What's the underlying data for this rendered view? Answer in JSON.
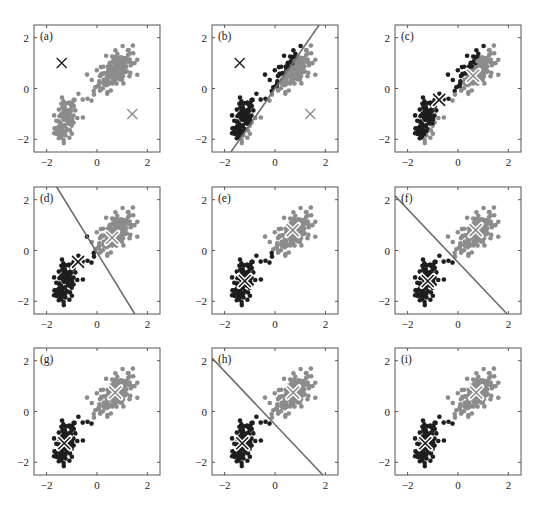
{
  "colors": {
    "dark": "#1e1e1e",
    "gray": "#8c8c8c",
    "axis": "#555555",
    "boundary": "#6e6e6e",
    "centroid_outline": "#ffffff"
  },
  "chart_data": [
    {
      "type": "scatter",
      "panel": "(a)",
      "xlim": [
        -2.5,
        2.5
      ],
      "ylim": [
        -2.5,
        2.5
      ],
      "xticks": [
        -2,
        0,
        2
      ],
      "yticks": [
        -2,
        0,
        2
      ],
      "coloring": "all-gray",
      "centroids": [
        {
          "x": -1.4,
          "y": 1.0,
          "color": "dark",
          "style": "cross"
        },
        {
          "x": 1.4,
          "y": -1.0,
          "color": "gray",
          "style": "cross"
        }
      ],
      "boundary": null
    },
    {
      "type": "scatter",
      "panel": "(b)",
      "xlim": [
        -2.5,
        2.5
      ],
      "ylim": [
        -2.5,
        2.5
      ],
      "xticks": [
        -2,
        0,
        2
      ],
      "yticks": [
        -2,
        0,
        2
      ],
      "coloring": "boundary",
      "centroids": [
        {
          "x": -1.4,
          "y": 1.0,
          "color": "dark",
          "style": "cross"
        },
        {
          "x": 1.4,
          "y": -1.0,
          "color": "gray",
          "style": "cross"
        }
      ],
      "boundary": {
        "x1": -1.75,
        "y1": -2.5,
        "x2": 1.75,
        "y2": 2.5
      }
    },
    {
      "type": "scatter",
      "panel": "(c)",
      "xlim": [
        -2.5,
        2.5
      ],
      "ylim": [
        -2.5,
        2.5
      ],
      "xticks": [
        -2,
        0,
        2
      ],
      "yticks": [
        -2,
        0,
        2
      ],
      "coloring": "boundary-b",
      "centroids": [
        {
          "x": -0.75,
          "y": -0.45,
          "color": "dark",
          "style": "cross-outline"
        },
        {
          "x": 0.6,
          "y": 0.5,
          "color": "gray",
          "style": "cross-outline"
        }
      ],
      "boundary": null
    },
    {
      "type": "scatter",
      "panel": "(d)",
      "xlim": [
        -2.5,
        2.5
      ],
      "ylim": [
        -2.5,
        2.5
      ],
      "xticks": [
        -2,
        0,
        2
      ],
      "yticks": [
        -2,
        0,
        2
      ],
      "coloring": "boundary",
      "centroids": [
        {
          "x": -0.75,
          "y": -0.45,
          "color": "dark",
          "style": "cross-outline"
        },
        {
          "x": 0.6,
          "y": 0.5,
          "color": "gray",
          "style": "cross-outline"
        }
      ],
      "boundary": {
        "x1": -1.6,
        "y1": 2.5,
        "x2": 1.5,
        "y2": -2.5
      }
    },
    {
      "type": "scatter",
      "panel": "(e)",
      "xlim": [
        -2.5,
        2.5
      ],
      "ylim": [
        -2.5,
        2.5
      ],
      "xticks": [
        -2,
        0,
        2
      ],
      "yticks": [
        -2,
        0,
        2
      ],
      "coloring": "boundary-d",
      "centroids": [
        {
          "x": -1.2,
          "y": -1.2,
          "color": "dark",
          "style": "cross-outline"
        },
        {
          "x": 0.7,
          "y": 0.8,
          "color": "gray",
          "style": "cross-outline"
        }
      ],
      "boundary": null
    },
    {
      "type": "scatter",
      "panel": "(f)",
      "xlim": [
        -2.5,
        2.5
      ],
      "ylim": [
        -2.5,
        2.5
      ],
      "xticks": [
        -2,
        0,
        2
      ],
      "yticks": [
        -2,
        0,
        2
      ],
      "coloring": "boundary",
      "centroids": [
        {
          "x": -1.2,
          "y": -1.2,
          "color": "dark",
          "style": "cross-outline"
        },
        {
          "x": 0.7,
          "y": 0.8,
          "color": "gray",
          "style": "cross-outline"
        }
      ],
      "boundary": {
        "x1": -2.5,
        "y1": 2.15,
        "x2": 1.95,
        "y2": -2.5
      }
    },
    {
      "type": "scatter",
      "panel": "(g)",
      "xlim": [
        -2.5,
        2.5
      ],
      "ylim": [
        -2.5,
        2.5
      ],
      "xticks": [
        -2,
        0,
        2
      ],
      "yticks": [
        -2,
        0,
        2
      ],
      "coloring": "boundary-f",
      "centroids": [
        {
          "x": -1.3,
          "y": -1.25,
          "color": "dark",
          "style": "cross-outline"
        },
        {
          "x": 0.72,
          "y": 0.75,
          "color": "gray",
          "style": "cross-outline"
        }
      ],
      "boundary": null
    },
    {
      "type": "scatter",
      "panel": "(h)",
      "xlim": [
        -2.5,
        2.5
      ],
      "ylim": [
        -2.5,
        2.5
      ],
      "xticks": [
        -2,
        0,
        2
      ],
      "yticks": [
        -2,
        0,
        2
      ],
      "coloring": "boundary",
      "centroids": [
        {
          "x": -1.3,
          "y": -1.25,
          "color": "dark",
          "style": "cross-outline"
        },
        {
          "x": 0.72,
          "y": 0.75,
          "color": "gray",
          "style": "cross-outline"
        }
      ],
      "boundary": {
        "x1": -2.5,
        "y1": 2.1,
        "x2": 1.9,
        "y2": -2.5
      }
    },
    {
      "type": "scatter",
      "panel": "(i)",
      "xlim": [
        -2.5,
        2.5
      ],
      "ylim": [
        -2.5,
        2.5
      ],
      "xticks": [
        -2,
        0,
        2
      ],
      "yticks": [
        -2,
        0,
        2
      ],
      "coloring": "boundary-h",
      "centroids": [
        {
          "x": -1.3,
          "y": -1.25,
          "color": "dark",
          "style": "cross-outline"
        },
        {
          "x": 0.72,
          "y": 0.75,
          "color": "gray",
          "style": "cross-outline"
        }
      ],
      "boundary": null
    }
  ],
  "layout": {
    "columns_x": [
      34,
      212,
      395
    ],
    "rows_y": [
      25,
      187,
      348
    ],
    "box_w": 126,
    "box_h": 127
  },
  "clusters": [
    {
      "name": "lower",
      "cx": -1.25,
      "cy": -1.25,
      "sx": 0.22,
      "sy": 0.42,
      "rho": 0.35,
      "n": 95
    },
    {
      "name": "upper",
      "cx": 0.75,
      "cy": 0.75,
      "sx": 0.33,
      "sy": 0.38,
      "rho": 0.45,
      "n": 165
    },
    {
      "name": "bridge",
      "cx": -0.2,
      "cy": -0.2,
      "sx": 0.35,
      "sy": 0.3,
      "rho": 0.7,
      "n": 12
    }
  ]
}
